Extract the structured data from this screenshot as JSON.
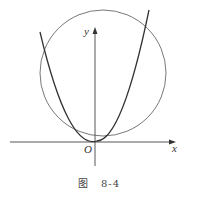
{
  "figure": {
    "caption_prefix": "图",
    "caption_number": "8-4"
  },
  "axes": {
    "x_label": "x",
    "y_label": "y",
    "origin_label": "O"
  },
  "curves": [
    {
      "name": "parabola",
      "description": "upward parabola with vertex at origin"
    },
    {
      "name": "circle",
      "description": "circle above x-axis intersecting parabola"
    }
  ]
}
